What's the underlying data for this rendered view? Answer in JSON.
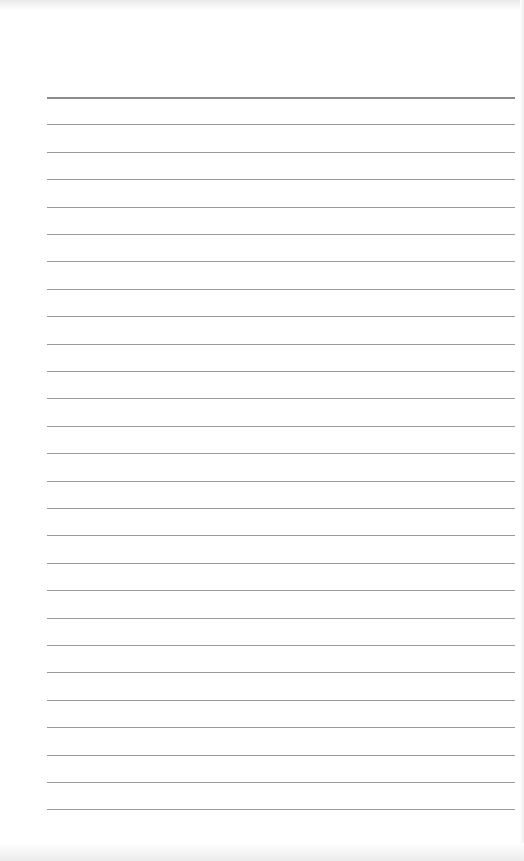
{
  "page": {
    "type": "lined-paper",
    "background": "#ffffff",
    "rule_color": "#9a9a9a",
    "header_rule_color": "#8a8a8a",
    "rule_count": 27,
    "first_rule_y": 97,
    "rule_spacing": 27.4,
    "rule_left": 47,
    "rule_width": 468
  }
}
